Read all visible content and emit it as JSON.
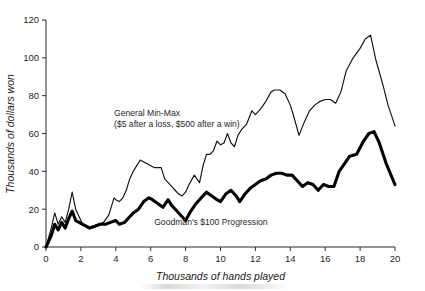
{
  "chart_data": {
    "type": "line",
    "title": "",
    "xlabel": "Thousands of hands played",
    "ylabel": "Thousands of dollars won",
    "xlim": [
      0,
      20
    ],
    "ylim": [
      0,
      120
    ],
    "xticks": [
      0,
      2,
      4,
      6,
      8,
      10,
      12,
      14,
      16,
      18,
      20
    ],
    "yticks": [
      0,
      20,
      40,
      60,
      80,
      100,
      120
    ],
    "grid": false,
    "legend": "inline-annotations",
    "annotations": [
      {
        "name": "general-min-max-label",
        "line1": "General Min-Max",
        "line2": "($5 after a loss, $500 after a win)",
        "x": 3.9,
        "y": 69
      },
      {
        "name": "goodman-label",
        "line1": "Goodman's $100 Progression",
        "x": 6.2,
        "y": 11.5
      }
    ],
    "series": [
      {
        "name": "General Min-Max",
        "style": "thin",
        "color": "#111111",
        "x": [
          0,
          0.3,
          0.5,
          0.7,
          0.9,
          1.1,
          1.3,
          1.5,
          1.7,
          1.9,
          2.1,
          2.3,
          2.5,
          2.7,
          3.0,
          3.3,
          3.6,
          3.9,
          4.0,
          4.2,
          4.4,
          4.6,
          4.8,
          5.0,
          5.2,
          5.4,
          5.6,
          5.8,
          6.0,
          6.2,
          6.4,
          6.6,
          6.8,
          7.0,
          7.2,
          7.4,
          7.6,
          7.8,
          8.0,
          8.2,
          8.5,
          8.8,
          9.0,
          9.2,
          9.4,
          9.6,
          9.8,
          10.0,
          10.2,
          10.4,
          10.6,
          10.8,
          11.0,
          11.2,
          11.5,
          11.8,
          12.0,
          12.3,
          12.6,
          12.9,
          13.1,
          13.4,
          13.7,
          14.0,
          14.2,
          14.5,
          14.8,
          15.1,
          15.4,
          15.7,
          16.0,
          16.3,
          16.6,
          16.9,
          17.2,
          17.6,
          18.0,
          18.3,
          18.6,
          18.9,
          19.3,
          19.6,
          20.0
        ],
        "y": [
          0,
          10,
          18,
          12,
          16,
          13,
          20,
          29,
          20,
          16,
          12,
          11,
          10,
          11,
          12,
          13,
          17,
          26,
          25,
          24,
          26,
          30,
          36,
          40,
          43,
          46,
          45,
          44,
          43,
          42,
          42,
          42,
          36,
          34,
          32,
          30,
          28,
          27,
          29,
          33,
          38,
          34,
          43,
          49,
          49,
          51,
          56,
          54,
          55,
          60,
          55,
          53,
          59,
          62,
          65,
          72,
          70,
          73,
          77,
          82,
          83,
          83,
          81,
          75,
          69,
          59,
          66,
          72,
          75,
          77,
          78,
          78,
          76,
          82,
          93,
          100,
          105,
          110,
          112,
          99,
          86,
          75,
          64
        ]
      },
      {
        "name": "Goodman's $100 Progression",
        "style": "thick",
        "color": "#000000",
        "x": [
          0,
          0.3,
          0.5,
          0.7,
          0.9,
          1.1,
          1.3,
          1.5,
          1.7,
          1.9,
          2.1,
          2.3,
          2.5,
          2.8,
          3.1,
          3.4,
          3.7,
          4.0,
          4.2,
          4.5,
          4.8,
          5.0,
          5.3,
          5.6,
          5.9,
          6.1,
          6.4,
          6.7,
          7.0,
          7.2,
          7.5,
          7.8,
          8.0,
          8.3,
          8.6,
          8.9,
          9.2,
          9.5,
          9.8,
          10.0,
          10.3,
          10.6,
          10.9,
          11.1,
          11.4,
          11.7,
          12.0,
          12.3,
          12.6,
          12.9,
          13.2,
          13.5,
          13.8,
          14.1,
          14.4,
          14.7,
          15.0,
          15.3,
          15.6,
          15.9,
          16.2,
          16.5,
          16.8,
          17.1,
          17.4,
          17.8,
          18.2,
          18.5,
          18.8,
          19.1,
          19.5,
          20.0
        ],
        "y": [
          0,
          6,
          12,
          9,
          13,
          10,
          15,
          19,
          14,
          13,
          12,
          11,
          10,
          11,
          12,
          12,
          13,
          14,
          12,
          13,
          16,
          18,
          20,
          24,
          26,
          25,
          23,
          21,
          25,
          22,
          19,
          16,
          14,
          19,
          23,
          26,
          29,
          27,
          25,
          24,
          28,
          30,
          27,
          24,
          28,
          31,
          33,
          35,
          36,
          38,
          39,
          39,
          38,
          38,
          35,
          32,
          34,
          33,
          30,
          33,
          32,
          32,
          40,
          44,
          48,
          49,
          56,
          60,
          61,
          55,
          44,
          33
        ]
      }
    ]
  }
}
